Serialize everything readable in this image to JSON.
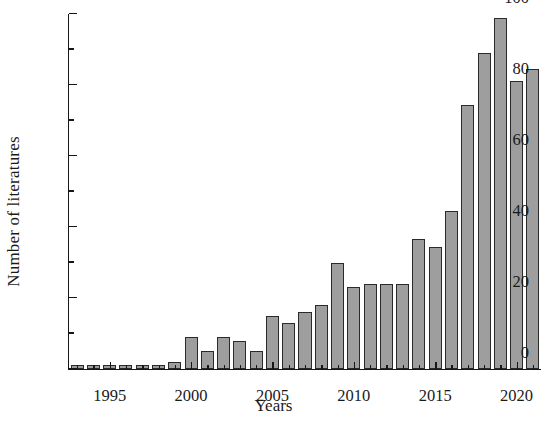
{
  "chart_data": {
    "type": "bar",
    "title": "",
    "xlabel": "Years",
    "ylabel": "Number of literatures",
    "categories": [
      1993,
      1994,
      1995,
      1996,
      1997,
      1998,
      1999,
      2000,
      2001,
      2002,
      2003,
      2004,
      2005,
      2006,
      2007,
      2008,
      2009,
      2010,
      2011,
      2012,
      2013,
      2014,
      2015,
      2016,
      2017,
      2018,
      2019,
      2020,
      2021
    ],
    "values": [
      1,
      1,
      1,
      1,
      1,
      1,
      2,
      9,
      5,
      9,
      8,
      5,
      15,
      13,
      16,
      18,
      30,
      23,
      24,
      24,
      24,
      36.5,
      34.5,
      44.5,
      74.5,
      89,
      99,
      81,
      84.5
    ],
    "xlim": [
      1992.5,
      2021.5
    ],
    "ylim": [
      0,
      100
    ],
    "x_major_ticks": [
      1995,
      2000,
      2005,
      2010,
      2015,
      2020
    ],
    "x_minor_ticks": [
      1993,
      1994,
      1996,
      1997,
      1998,
      1999,
      2001,
      2002,
      2003,
      2004,
      2006,
      2007,
      2008,
      2009,
      2011,
      2012,
      2013,
      2014,
      2016,
      2017,
      2018,
      2019,
      2021
    ],
    "y_major_ticks": [
      0,
      20,
      40,
      60,
      80,
      100
    ],
    "y_minor_ticks": [
      10,
      30,
      50,
      70,
      90
    ],
    "x_tick_labels": [
      "1995",
      "2000",
      "2005",
      "2010",
      "2015",
      "2020"
    ],
    "y_tick_labels": [
      "0",
      "20",
      "40",
      "60",
      "80",
      "100"
    ],
    "grid": false,
    "legend": null,
    "bar_color": "#9e9e9e",
    "bar_edge_color": "#2a2a2a",
    "axis_color": "#171717",
    "background": "#ffffff"
  }
}
